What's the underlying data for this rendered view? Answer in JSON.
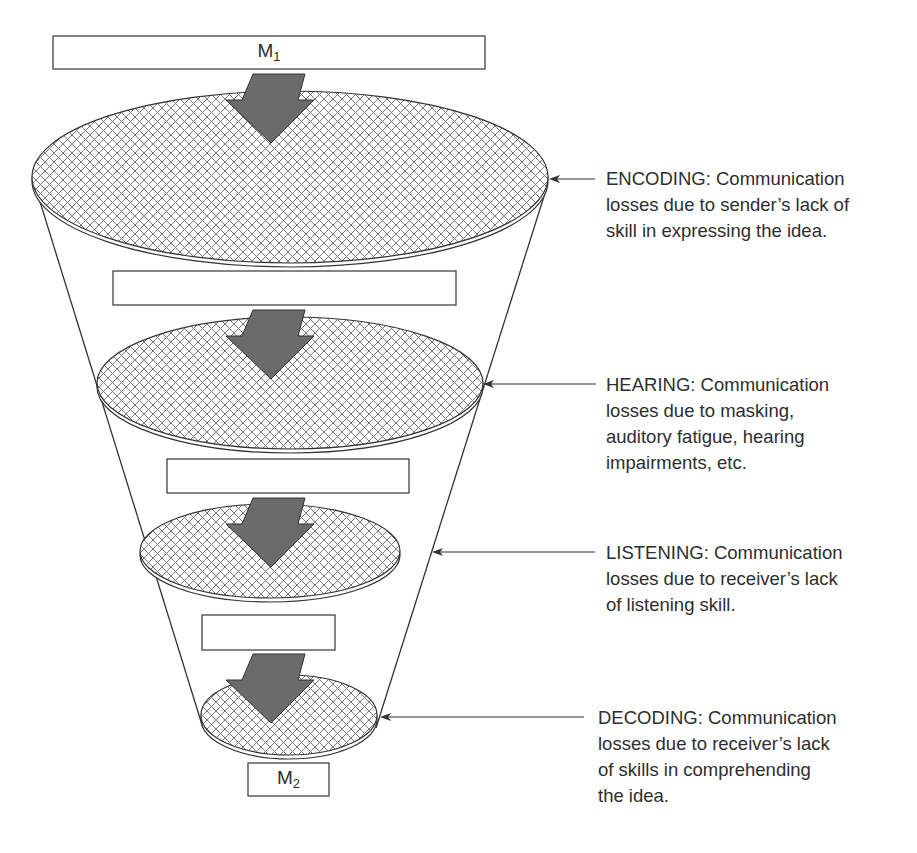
{
  "diagram": {
    "type": "communication-loss-funnel",
    "input_message": {
      "symbol": "M",
      "subscript": "1"
    },
    "output_message": {
      "symbol": "M",
      "subscript": "2"
    },
    "stages": [
      {
        "name": "ENCODING",
        "lines": [
          "ENCODING: Communication",
          "losses due to sender’s lack of",
          "skill in expressing the idea."
        ]
      },
      {
        "name": "HEARING",
        "lines": [
          "HEARING: Communication",
          "losses due to masking,",
          "auditory fatigue, hearing",
          "impairments, etc."
        ]
      },
      {
        "name": "LISTENING",
        "lines": [
          "LISTENING: Communication",
          "losses due to receiver’s lack",
          "of listening skill."
        ]
      },
      {
        "name": "DECODING",
        "lines": [
          "DECODING: Communication",
          "losses due to receiver’s lack",
          "of skills in comprehending",
          "the idea."
        ]
      }
    ],
    "colors": {
      "arrow_fill": "#6b6b6b",
      "outline": "#333333",
      "hatch": "#7a7a7a",
      "background": "#ffffff"
    }
  }
}
